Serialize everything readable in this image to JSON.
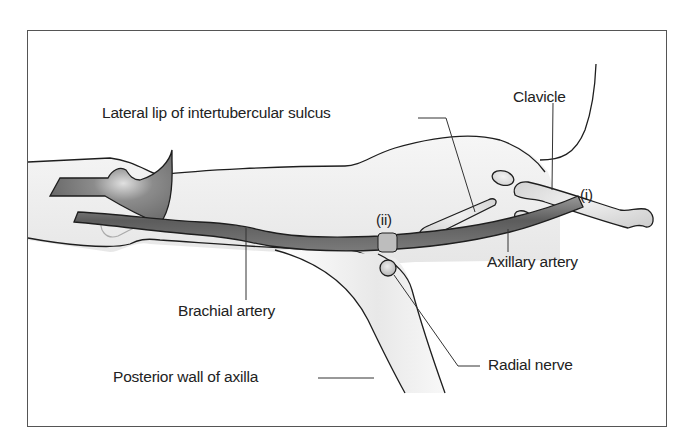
{
  "diagram": {
    "labels": {
      "lateral_lip": "Lateral lip of intertubercular sulcus",
      "clavicle": "Clavicle",
      "point_i": "(i)",
      "point_ii": "(ii)",
      "axillary_artery": "Axillary artery",
      "brachial_artery": "Brachial artery",
      "radial_nerve": "Radial nerve",
      "posterior_wall": "Posterior wall of axilla"
    },
    "colors": {
      "outline": "#1e1e1e",
      "artery_dark": "#5a5a5a",
      "artery_light": "#b5b5b5",
      "skin_shade": "#ececec",
      "bone": "#dadada",
      "frame": "#555555"
    }
  }
}
